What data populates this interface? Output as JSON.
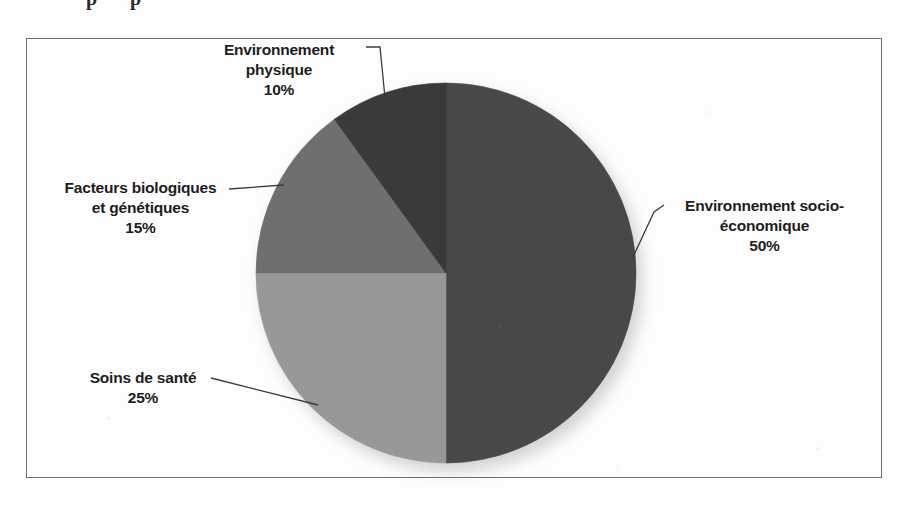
{
  "page": {
    "cut_off_text_above_figure": "p p"
  },
  "chart_data": {
    "type": "pie",
    "title": "",
    "categories": [
      "Environnement socio-économique",
      "Soins de santé",
      "Facteurs biologiques et génétiques",
      "Environnement physique"
    ],
    "values": [
      50,
      25,
      15,
      10
    ],
    "value_labels": [
      "50%",
      "25%",
      "15%",
      "10%"
    ],
    "unit": "%",
    "total": 100,
    "legend": "none",
    "labels_placement": "callout-with-leader-lines",
    "start_angle_deg": 0,
    "direction": "clockwise",
    "colors": [
      "#484848",
      "#989898",
      "#6f6f6f",
      "#3a3a3a"
    ],
    "slices": [
      {
        "label": "Environnement socio-économique",
        "value": 50,
        "value_label": "50%",
        "color": "#484848"
      },
      {
        "label": "Soins de santé",
        "value": 25,
        "value_label": "25%",
        "color": "#989898"
      },
      {
        "label": "Facteurs biologiques et génétiques",
        "value": 15,
        "value_label": "15%",
        "color": "#6f6f6f"
      },
      {
        "label": "Environnement physique",
        "value": 10,
        "value_label": "10%",
        "color": "#3a3a3a"
      }
    ]
  },
  "callouts": {
    "physique": {
      "line1": "Environnement",
      "line2": "physique",
      "pct": "10%"
    },
    "biologiques": {
      "line1": "Facteurs biologiques",
      "line2": "et génétiques",
      "pct": "15%"
    },
    "socio": {
      "line1": "Environnement socio-",
      "line2": "économique",
      "pct": "50%"
    },
    "soins": {
      "line1": "Soins de santé",
      "line2": "",
      "pct": "25%"
    }
  },
  "colors": {
    "frame_border": "#6f6f6f",
    "leader_line": "#3a3a3a",
    "text": "#1e1e1e",
    "background": "#fdfdfd"
  }
}
